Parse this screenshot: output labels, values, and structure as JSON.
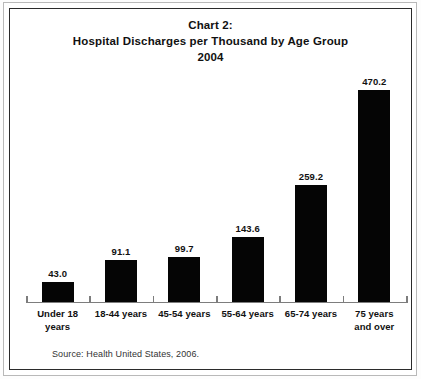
{
  "frame": {
    "border_color": "#2b2b2b",
    "outer_rule_color": "#b9b9b9",
    "background": "#ffffff"
  },
  "title": {
    "line1": "Chart 2:",
    "line2": "Hospital Discharges per Thousand by Age Group",
    "line3": "2004"
  },
  "source": {
    "text": "Source: Health United States, 2006."
  },
  "chart_data": {
    "type": "bar",
    "title": "Chart 2: Hospital Discharges per Thousand by Age Group 2004",
    "subtitle": "2004",
    "xlabel": "",
    "ylabel": "",
    "ylim": [
      0,
      470.2
    ],
    "grid": false,
    "legend": "none",
    "bar_color": "#050505",
    "categories": [
      "Under 18 years",
      "18-44 years",
      "45-54 years",
      "55-64 years",
      "65-74 years",
      "75 years and over"
    ],
    "category_lines": [
      [
        "Under 18",
        "years"
      ],
      [
        "18-44 years",
        ""
      ],
      [
        "45-54 years",
        ""
      ],
      [
        "55-64 years",
        ""
      ],
      [
        "65-74 years",
        ""
      ],
      [
        "75 years",
        "and over"
      ]
    ],
    "values": [
      43.0,
      91.1,
      99.7,
      143.6,
      259.2,
      470.2
    ],
    "value_labels": [
      "43.0",
      "91.1",
      "99.7",
      "143.6",
      "259.2",
      "470.2"
    ],
    "source": "Source: Health United States, 2006."
  }
}
